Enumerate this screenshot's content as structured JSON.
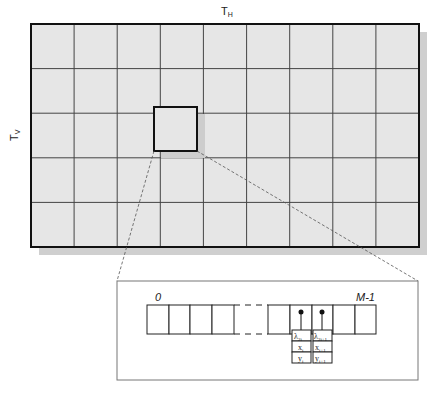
{
  "frame": {
    "top_label": "T",
    "top_label_sub": "H",
    "side_label": "T",
    "side_label_sub": "V",
    "columns": 9,
    "rows": 5,
    "fill_color": "#e6e6e6",
    "shadow_color": "#c8c8c8"
  },
  "zoom_panel": {
    "start_index": "0",
    "end_index": "M-1",
    "record_left": {
      "lambda": "λ",
      "lambda_sub": "2i",
      "x": "x",
      "x_sub": "i",
      "y": "y",
      "y_sub": "i"
    },
    "record_right": {
      "lambda": "λ",
      "lambda_sub": "2i+1",
      "x": "x",
      "x_sub": "i+1",
      "y": "y",
      "y_sub": "i+1"
    }
  }
}
